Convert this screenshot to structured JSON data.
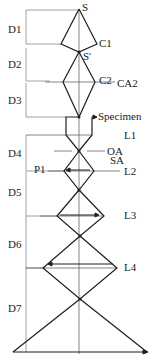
{
  "diagram": {
    "colors": {
      "line": "#1e1e1e",
      "thin": "#555555",
      "bracket": "#888888"
    },
    "labels": {
      "source": "S",
      "source_image": "S'",
      "c1": "C1",
      "c2": "C2",
      "ca2": "CA2",
      "specimen": "Specimen",
      "l1": "L1",
      "oa": "OA",
      "sa": "SA",
      "p1": "P1",
      "l2": "L2",
      "l3": "L3",
      "l4": "L4"
    },
    "distances": [
      "D1",
      "D2",
      "D3",
      "D4",
      "D5",
      "D6",
      "D7"
    ]
  }
}
